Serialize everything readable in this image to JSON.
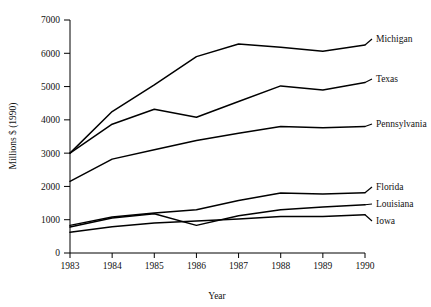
{
  "chart_data": {
    "type": "line",
    "title": "",
    "subtitle": "",
    "xlabel": "Year",
    "ylabel": "Millions $ (1990)",
    "x": [
      1983,
      1984,
      1985,
      1986,
      1987,
      1988,
      1989,
      1990
    ],
    "xticklabels": [
      "1983",
      "1984",
      "1985",
      "1986",
      "1987",
      "1988",
      "1989",
      "1990"
    ],
    "yticklabels": [
      "0",
      "1000",
      "2000",
      "3000",
      "4000",
      "5000",
      "6000",
      "7000"
    ],
    "yticks": [
      0,
      1000,
      2000,
      3000,
      4000,
      5000,
      6000,
      7000
    ],
    "xlim": [
      1983,
      1990
    ],
    "ylim": [
      0,
      7000
    ],
    "grid": false,
    "legend_position": "right-inline-labels",
    "series": [
      {
        "name": "Michigan",
        "values": [
          3000,
          4250,
          5050,
          5900,
          6280,
          6180,
          6060,
          6250
        ]
      },
      {
        "name": "Texas",
        "values": [
          3000,
          3870,
          4320,
          4080,
          4550,
          5020,
          4900,
          5120
        ]
      },
      {
        "name": "Pennsylvania",
        "values": [
          2150,
          2820,
          3100,
          3380,
          3600,
          3800,
          3760,
          3800
        ]
      },
      {
        "name": "Florida",
        "values": [
          830,
          1080,
          1200,
          1300,
          1580,
          1800,
          1770,
          1810
        ]
      },
      {
        "name": "Louisiana",
        "values": [
          780,
          1050,
          1180,
          830,
          1120,
          1300,
          1380,
          1450
        ]
      },
      {
        "name": "Iowa",
        "values": [
          620,
          790,
          900,
          960,
          1020,
          1100,
          1100,
          1150
        ]
      }
    ]
  },
  "labels": {
    "michigan": "Michigan",
    "texas": "Texas",
    "pennsylvania": "Pennsylvania",
    "florida": "Florida",
    "louisiana": "Louisiana",
    "iowa": "Iowa"
  },
  "colors": {
    "line": "#000000",
    "axis": "#000000",
    "background": "#ffffff"
  }
}
